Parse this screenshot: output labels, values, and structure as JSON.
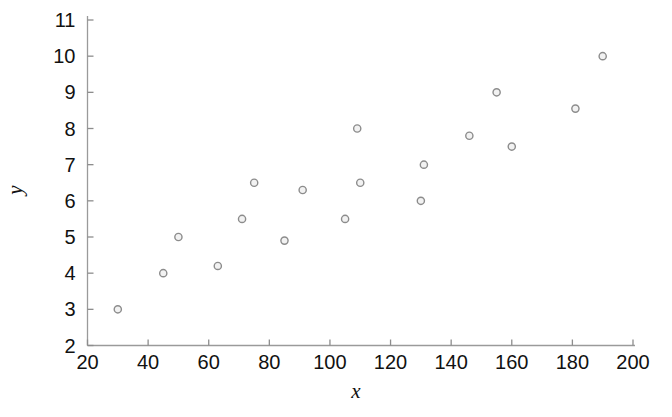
{
  "chart_data": {
    "type": "scatter",
    "title": "",
    "subtitle": "",
    "xlabel": "x",
    "ylabel": "y",
    "xlim": [
      20,
      200
    ],
    "ylim": [
      2,
      11
    ],
    "xticks": [
      20,
      40,
      60,
      80,
      100,
      120,
      140,
      160,
      180,
      200
    ],
    "yticks": [
      2,
      3,
      4,
      5,
      6,
      7,
      8,
      9,
      10,
      11
    ],
    "xtick_labels": [
      "20",
      "40",
      "60",
      "80",
      "100",
      "120",
      "140",
      "160",
      "180",
      "200"
    ],
    "ytick_labels": [
      "2",
      "3",
      "4",
      "5",
      "6",
      "7",
      "8",
      "9",
      "10",
      "11"
    ],
    "grid": false,
    "legend": null,
    "legend_position": "none",
    "marker": "open-circle",
    "marker_color": "#8c8c8c",
    "marker_fill": "#f2f2f2",
    "axis_color": "#9a9a9a",
    "background": "#ffffff",
    "series": [
      {
        "name": "observations",
        "points": [
          {
            "x": 30,
            "y": 3.0
          },
          {
            "x": 45,
            "y": 4.0
          },
          {
            "x": 50,
            "y": 5.0
          },
          {
            "x": 63,
            "y": 4.2
          },
          {
            "x": 71,
            "y": 5.5
          },
          {
            "x": 75,
            "y": 6.5
          },
          {
            "x": 85,
            "y": 4.9
          },
          {
            "x": 91,
            "y": 6.3
          },
          {
            "x": 105,
            "y": 5.5
          },
          {
            "x": 109,
            "y": 8.0
          },
          {
            "x": 110,
            "y": 6.5
          },
          {
            "x": 130,
            "y": 6.0
          },
          {
            "x": 131,
            "y": 7.0
          },
          {
            "x": 146,
            "y": 7.8
          },
          {
            "x": 155,
            "y": 9.0
          },
          {
            "x": 160,
            "y": 7.5
          },
          {
            "x": 181,
            "y": 8.55
          },
          {
            "x": 190,
            "y": 10.0
          }
        ]
      }
    ]
  },
  "figure": {
    "name": "scatter-plot-x-vs-y",
    "point_count": 18
  }
}
